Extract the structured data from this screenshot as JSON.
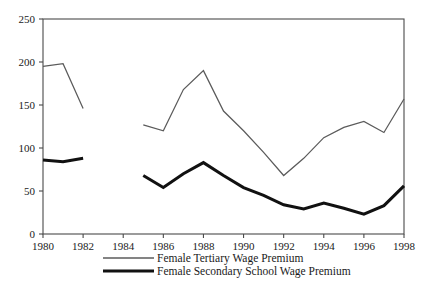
{
  "chart_data": {
    "type": "line",
    "title": "",
    "subtitle": "",
    "xlabel": "",
    "ylabel": "",
    "xlim": [
      1980,
      1998
    ],
    "ylim": [
      0,
      250
    ],
    "grid": false,
    "legend_position": "bottom",
    "x_ticks": [
      "1980",
      "1982",
      "1984",
      "1986",
      "1988",
      "1990",
      "1992",
      "1994",
      "1996",
      "1998"
    ],
    "x_tick_values": [
      1980,
      1982,
      1984,
      1986,
      1988,
      1990,
      1992,
      1994,
      1996,
      1998
    ],
    "y_ticks": [
      "0",
      "50",
      "100",
      "150",
      "200",
      "250"
    ],
    "y_tick_values": [
      0,
      50,
      100,
      150,
      200,
      250
    ],
    "series": [
      {
        "name": "Female Tertiary Wage Premium",
        "style": "thin",
        "color": "#5b5b5b",
        "segments": [
          {
            "x": [
              1980,
              1981,
              1982
            ],
            "values": [
              195,
              198,
              146
            ]
          },
          {
            "x": [
              1985,
              1986,
              1987,
              1988,
              1989,
              1990,
              1991,
              1992,
              1993,
              1994,
              1995,
              1996,
              1997,
              1998
            ],
            "values": [
              127,
              120,
              168,
              190,
              143,
              120,
              95,
              68,
              88,
              112,
              124,
              131,
              118,
              157
            ]
          }
        ]
      },
      {
        "name": "Female Secondary School Wage Premium",
        "style": "thick",
        "color": "#111111",
        "segments": [
          {
            "x": [
              1980,
              1981,
              1982
            ],
            "values": [
              86,
              84,
              88
            ]
          },
          {
            "x": [
              1985,
              1986,
              1987,
              1988,
              1989,
              1990,
              1991,
              1992,
              1993,
              1994,
              1995,
              1996,
              1997,
              1998
            ],
            "values": [
              68,
              54,
              70,
              83,
              68,
              54,
              45,
              34,
              29,
              36,
              30,
              23,
              33,
              56
            ]
          }
        ]
      }
    ]
  },
  "legend": {
    "entries": [
      {
        "label": "Female Tertiary Wage Premium",
        "style": "thin"
      },
      {
        "label": "Female Secondary School Wage Premium",
        "style": "thick"
      }
    ]
  }
}
